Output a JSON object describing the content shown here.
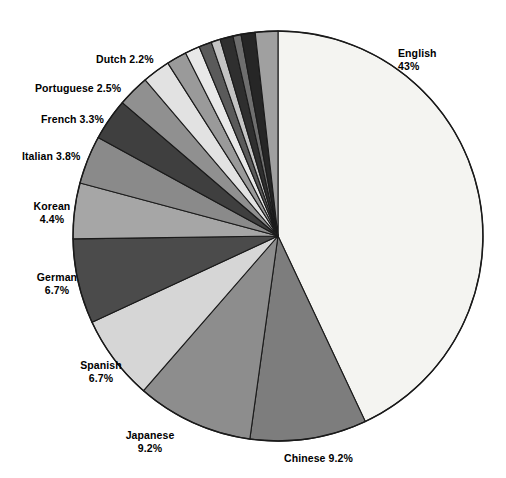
{
  "chart_data": {
    "type": "pie",
    "title": "",
    "subtitle": "",
    "xlabel": "",
    "ylabel": "",
    "legend_position": "none",
    "grid": false,
    "units": "percent",
    "start_angle_deg": 0,
    "direction": "clockwise",
    "categories": [
      "English",
      "Chinese",
      "Japanese",
      "Spanish",
      "German",
      "Korean",
      "Italian",
      "French",
      "Portuguese",
      "Dutch"
    ],
    "values": [
      43,
      9.2,
      9.2,
      6.7,
      6.7,
      4.4,
      3.8,
      3.3,
      2.5,
      2.2
    ],
    "slices": [
      {
        "name": "English",
        "value": 43,
        "value_text": "43%",
        "label_line1": "English",
        "label_line2": "43%",
        "label_single": "",
        "color": "#f4f4f1",
        "start_deg": 0,
        "end_deg": 154.8,
        "label_x": 398,
        "label_y": 47,
        "label_align": "left",
        "label_lines": 2
      },
      {
        "name": "Chinese",
        "value": 9.2,
        "value_text": "9.2%",
        "label_line1": "Chinese 9.2%",
        "label_line2": "",
        "label_single": "Chinese 9.2%",
        "color": "#7d7d7d",
        "start_deg": 154.8,
        "end_deg": 187.9,
        "label_x": 284,
        "label_y": 452,
        "label_align": "left",
        "label_lines": 1
      },
      {
        "name": "Japanese",
        "value": 9.2,
        "value_text": "9.2%",
        "label_line1": "Japanese",
        "label_line2": "9.2%",
        "label_single": "",
        "color": "#8d8d8d",
        "start_deg": 187.9,
        "end_deg": 221.0,
        "label_x": 150,
        "label_y": 429,
        "label_align": "center",
        "label_lines": 2
      },
      {
        "name": "Spanish",
        "value": 6.7,
        "value_text": "6.7%",
        "label_line1": "Spanish",
        "label_line2": "6.7%",
        "label_single": "",
        "color": "#d6d6d6",
        "start_deg": 221.0,
        "end_deg": 245.1,
        "label_x": 101,
        "label_y": 359,
        "label_align": "center",
        "label_lines": 2
      },
      {
        "name": "German",
        "value": 6.7,
        "value_text": "6.7%",
        "label_line1": "German",
        "label_line2": "6.7%",
        "label_single": "",
        "color": "#4b4b4b",
        "start_deg": 245.1,
        "end_deg": 269.2,
        "label_x": 57,
        "label_y": 271,
        "label_align": "center",
        "label_lines": 2
      },
      {
        "name": "Korean",
        "value": 4.4,
        "value_text": "4.4%",
        "label_line1": "Korean",
        "label_line2": "4.4%",
        "label_single": "",
        "color": "#a6a6a6",
        "start_deg": 269.2,
        "end_deg": 285.0,
        "label_x": 52,
        "label_y": 200,
        "label_align": "center",
        "label_lines": 2
      },
      {
        "name": "Italian",
        "value": 3.8,
        "value_text": "3.8%",
        "label_line1": "Italian 3.8%",
        "label_line2": "",
        "label_single": "Italian 3.8%",
        "color": "#8a8a8a",
        "start_deg": 285.0,
        "end_deg": 298.7,
        "label_x": 22,
        "label_y": 150,
        "label_align": "left",
        "label_lines": 1
      },
      {
        "name": "French",
        "value": 3.3,
        "value_text": "3.3%",
        "label_line1": "French 3.3%",
        "label_line2": "",
        "label_single": "French 3.3%",
        "color": "#3f3f3f",
        "start_deg": 298.7,
        "end_deg": 310.6,
        "label_x": 41,
        "label_y": 113,
        "label_align": "left",
        "label_lines": 1
      },
      {
        "name": "Portuguese",
        "value": 2.5,
        "value_text": "2.5%",
        "label_line1": "Portuguese 2.5%",
        "label_line2": "",
        "label_single": "Portuguese 2.5%",
        "color": "#909090",
        "start_deg": 310.6,
        "end_deg": 319.6,
        "label_x": 35,
        "label_y": 82,
        "label_align": "left",
        "label_lines": 1
      },
      {
        "name": "Dutch",
        "value": 2.2,
        "value_text": "2.2%",
        "label_line1": "Dutch 2.2%",
        "label_line2": "",
        "label_single": "Dutch 2.2%",
        "color": "#e2e2e2",
        "start_deg": 319.6,
        "end_deg": 327.5,
        "label_x": 96,
        "label_y": 53,
        "label_align": "left",
        "label_lines": 1
      }
    ],
    "unlabeled_slices": [
      {
        "name": "other-1",
        "color": "#9a9a9a",
        "start_deg": 327.5,
        "end_deg": 333.2
      },
      {
        "name": "other-2",
        "color": "#e8e8e8",
        "start_deg": 333.2,
        "end_deg": 337.4
      },
      {
        "name": "other-3",
        "color": "#5a5a5a",
        "start_deg": 337.4,
        "end_deg": 341.0
      },
      {
        "name": "other-4",
        "color": "#c4c4c4",
        "start_deg": 341.0,
        "end_deg": 343.6
      },
      {
        "name": "other-5",
        "color": "#2f2f2f",
        "start_deg": 343.6,
        "end_deg": 347.3
      },
      {
        "name": "other-6",
        "color": "#6e6e6e",
        "start_deg": 347.3,
        "end_deg": 349.6
      },
      {
        "name": "other-7",
        "color": "#262626",
        "start_deg": 349.6,
        "end_deg": 353.6
      },
      {
        "name": "other-8",
        "color": "#a0a0a0",
        "start_deg": 353.6,
        "end_deg": 360.0
      }
    ],
    "geometry": {
      "center_x": 278,
      "center_y": 236,
      "radius": 205
    },
    "colors": {
      "outline": "#1a1a1a",
      "background": "#ffffff",
      "label_text": "#000000"
    }
  }
}
